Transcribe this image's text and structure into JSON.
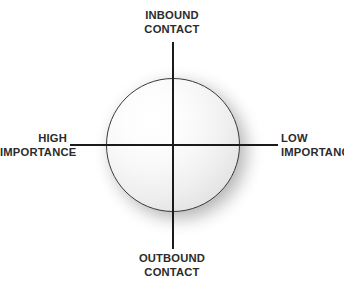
{
  "diagram": {
    "type": "quadrant-matrix",
    "title": "",
    "background_color": "#ffffff",
    "axis_color": "#1a1a1a",
    "label_color": "#2b2b2b",
    "shape": {
      "name": "sphere",
      "kind": "circle",
      "fill_highlight_color": "#ffffff",
      "fill_edge_color": "#cfcfcf",
      "outline_color": "#3a3a3a",
      "shadow_color": "#000000"
    },
    "axes": {
      "vertical": {
        "top_label": {
          "line1": "INBOUND",
          "line2": "CONTACT"
        },
        "bottom_label": {
          "line1": "OUTBOUND",
          "line2": "CONTACT"
        }
      },
      "horizontal": {
        "left_label": {
          "line1": "HIGH",
          "line2": "IMPORTANCE"
        },
        "right_label": {
          "line1": "LOW",
          "line2": "IMPORTANCE"
        }
      }
    }
  },
  "chart_data": {
    "type": "scatter",
    "title": "",
    "xlabel": "Importance",
    "ylabel": "Contact Direction",
    "grid": false,
    "legend": null,
    "axis_endpoints": {
      "x_left": "HIGH IMPORTANCE",
      "x_right": "LOW IMPORTANCE",
      "y_top": "INBOUND CONTACT",
      "y_bottom": "OUTBOUND CONTACT"
    },
    "quadrants": [
      {
        "position": "top-left",
        "x": "HIGH IMPORTANCE",
        "y": "INBOUND CONTACT",
        "label": ""
      },
      {
        "position": "top-right",
        "x": "LOW IMPORTANCE",
        "y": "INBOUND CONTACT",
        "label": ""
      },
      {
        "position": "bottom-left",
        "x": "HIGH IMPORTANCE",
        "y": "OUTBOUND CONTACT",
        "label": ""
      },
      {
        "position": "bottom-right",
        "x": "LOW IMPORTANCE",
        "y": "OUTBOUND CONTACT",
        "label": ""
      }
    ],
    "series": [
      {
        "name": "sphere",
        "x": [
          0
        ],
        "y": [
          0
        ],
        "marker": "circle",
        "size": 134
      }
    ]
  }
}
